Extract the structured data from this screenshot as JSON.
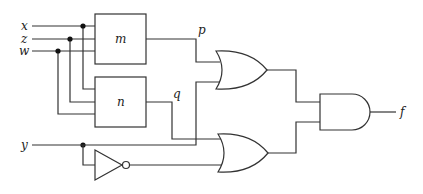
{
  "diagram": {
    "type": "logic-circuit",
    "inputs": [
      {
        "id": "x",
        "label": "x"
      },
      {
        "id": "z",
        "label": "z"
      },
      {
        "id": "w",
        "label": "w"
      },
      {
        "id": "y",
        "label": "y"
      }
    ],
    "blocks": [
      {
        "id": "m",
        "label": "m",
        "inputs": [
          "x",
          "z",
          "w"
        ],
        "output": "p"
      },
      {
        "id": "n",
        "label": "n",
        "inputs": [
          "x",
          "z",
          "w"
        ],
        "output": "q"
      }
    ],
    "signals": {
      "p": "p",
      "q": "q"
    },
    "gates": [
      {
        "id": "not1",
        "type": "NOT",
        "inputs": [
          "y"
        ]
      },
      {
        "id": "or1",
        "type": "OR",
        "inputs": [
          "p",
          "y"
        ]
      },
      {
        "id": "or2",
        "type": "OR",
        "inputs": [
          "q",
          "not y"
        ]
      },
      {
        "id": "and1",
        "type": "AND",
        "inputs": [
          "or1",
          "or2"
        ],
        "output": "f"
      }
    ],
    "output": {
      "id": "f",
      "label": "f"
    },
    "colors": {
      "line": "#333333",
      "background": "#ffffff"
    }
  }
}
